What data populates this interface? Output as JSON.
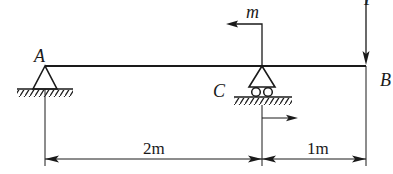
{
  "diagram": {
    "type": "beam-statics",
    "colors": {
      "ink": "#1a1a1a",
      "background": "#ffffff"
    },
    "beam": {
      "from": "A",
      "to": "B"
    },
    "points": {
      "A": {
        "label": "A",
        "support": "pin"
      },
      "C": {
        "label": "C",
        "support": "roller"
      },
      "B": {
        "label": "B",
        "support": "free end"
      }
    },
    "loads": {
      "moment": {
        "label": "m",
        "at": "C"
      },
      "force": {
        "label": "P",
        "at": "B",
        "direction": "down"
      }
    },
    "dimensions": [
      {
        "label": "2m",
        "from": "A",
        "to": "C"
      },
      {
        "label": "1m",
        "from": "C",
        "to": "B"
      }
    ]
  }
}
